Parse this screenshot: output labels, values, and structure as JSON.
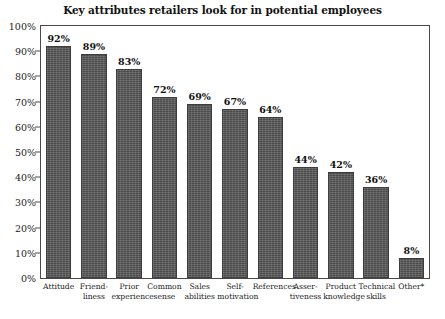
{
  "chart_data": {
    "type": "bar",
    "title": "Key attributes retailers look for in potential employees",
    "xlabel": "",
    "ylabel": "",
    "ylim": [
      0,
      100
    ],
    "y_ticks": [
      "0%",
      "10%",
      "20%",
      "30%",
      "40%",
      "50%",
      "60%",
      "70%",
      "80%",
      "90%",
      "100%"
    ],
    "y_tick_values": [
      0,
      10,
      20,
      30,
      40,
      50,
      60,
      70,
      80,
      90,
      100
    ],
    "grid": false,
    "legend": "none",
    "categories": [
      "Attitude",
      "Friend-liness",
      "Prior experience",
      "Common sense",
      "Sales abilities",
      "Self-motivation",
      "References",
      "Asser-tiveness",
      "Product knowledge",
      "Technical skills",
      "Other*"
    ],
    "category_lines": [
      [
        "Attitude"
      ],
      [
        "Friend-",
        "liness"
      ],
      [
        "Prior",
        "experience"
      ],
      [
        "Common",
        "sense"
      ],
      [
        "Sales",
        "abilities"
      ],
      [
        "Self-",
        "motivation"
      ],
      [
        "References"
      ],
      [
        "Asser-",
        "tiveness"
      ],
      [
        "Product",
        "knowledge"
      ],
      [
        "Technical",
        "skills"
      ],
      [
        "Other*"
      ]
    ],
    "values": [
      92,
      89,
      83,
      72,
      69,
      67,
      64,
      44,
      42,
      36,
      8
    ],
    "value_labels": [
      "92%",
      "89%",
      "83%",
      "72%",
      "69%",
      "67%",
      "64%",
      "44%",
      "42%",
      "36%",
      "8%"
    ],
    "bar_color": "#585858",
    "bar_edge_color": "#3d3d3d",
    "frame_color": "#4a4a4a",
    "background_color": "#ffffff",
    "text_color": "#111111"
  }
}
